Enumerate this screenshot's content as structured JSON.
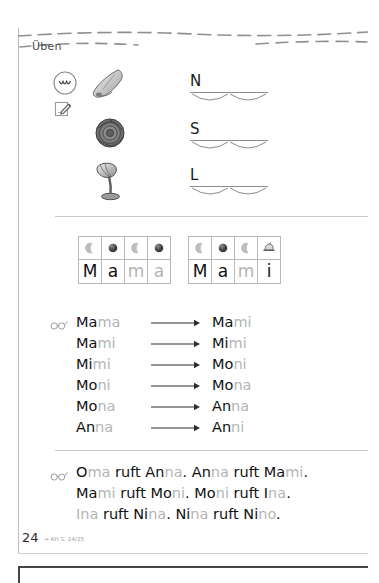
{
  "page": {
    "section_label": "Üben",
    "number": "24",
    "reference": "→ AH S. 24/25"
  },
  "icons": {
    "speak": "mouth-speak-icon",
    "write": "write-pencil-icon",
    "glasses": "glasses-read-icon",
    "consonant_marker": "crescent-moon-icon",
    "vowel_marker": "filled-circle-icon",
    "special_marker": "spinning-top-icon"
  },
  "letter_exercise": {
    "rows": [
      {
        "picture": "nose-picture",
        "letter": "N",
        "word": "Nase"
      },
      {
        "picture": "rose-picture",
        "letter": "S",
        "word": "Rose"
      },
      {
        "picture": "lamp-picture",
        "letter": "L",
        "word": "Lampe"
      }
    ]
  },
  "syllable_boxes": [
    {
      "word": "Mama",
      "cells": [
        {
          "char": "M",
          "tone": "dark",
          "marker": "crescent"
        },
        {
          "char": "a",
          "tone": "dark",
          "marker": "circle"
        },
        {
          "char": "m",
          "tone": "light",
          "marker": "crescent"
        },
        {
          "char": "a",
          "tone": "light",
          "marker": "circle"
        }
      ]
    },
    {
      "word": "Mami",
      "cells": [
        {
          "char": "M",
          "tone": "dark",
          "marker": "crescent"
        },
        {
          "char": "a",
          "tone": "dark",
          "marker": "circle"
        },
        {
          "char": "m",
          "tone": "light",
          "marker": "crescent"
        },
        {
          "char": "i",
          "tone": "dark",
          "marker": "top"
        }
      ]
    }
  ],
  "word_chain": {
    "arrow": "arrow-right-icon",
    "rows": [
      {
        "left": [
          {
            "t": "Ma",
            "tone": "dark"
          },
          {
            "t": "ma",
            "tone": "light"
          }
        ],
        "right": [
          {
            "t": "Ma",
            "tone": "dark"
          },
          {
            "t": "mi",
            "tone": "light"
          }
        ]
      },
      {
        "left": [
          {
            "t": "Ma",
            "tone": "dark"
          },
          {
            "t": "mi",
            "tone": "light"
          }
        ],
        "right": [
          {
            "t": "Mi",
            "tone": "dark"
          },
          {
            "t": "mi",
            "tone": "light"
          }
        ]
      },
      {
        "left": [
          {
            "t": "Mi",
            "tone": "dark"
          },
          {
            "t": "mi",
            "tone": "light"
          }
        ],
        "right": [
          {
            "t": "Mo",
            "tone": "dark"
          },
          {
            "t": "ni",
            "tone": "light"
          }
        ]
      },
      {
        "left": [
          {
            "t": "Mo",
            "tone": "dark"
          },
          {
            "t": "ni",
            "tone": "light"
          }
        ],
        "right": [
          {
            "t": "Mo",
            "tone": "dark"
          },
          {
            "t": "na",
            "tone": "light"
          }
        ]
      },
      {
        "left": [
          {
            "t": "Mo",
            "tone": "dark"
          },
          {
            "t": "na",
            "tone": "light"
          }
        ],
        "right": [
          {
            "t": "An",
            "tone": "dark"
          },
          {
            "t": "na",
            "tone": "light"
          }
        ]
      },
      {
        "left": [
          {
            "t": "An",
            "tone": "dark"
          },
          {
            "t": "na",
            "tone": "light"
          }
        ],
        "right": [
          {
            "t": "An",
            "tone": "dark"
          },
          {
            "t": "ni",
            "tone": "light"
          }
        ]
      }
    ]
  },
  "sentences": {
    "lines": [
      [
        {
          "t": "O",
          "tone": "dark"
        },
        {
          "t": "ma",
          "tone": "light"
        },
        {
          "t": " ruft ",
          "tone": "dark"
        },
        {
          "t": "An",
          "tone": "dark"
        },
        {
          "t": "na",
          "tone": "light"
        },
        {
          "t": ". ",
          "tone": "dark"
        },
        {
          "t": "An",
          "tone": "dark"
        },
        {
          "t": "na",
          "tone": "light"
        },
        {
          "t": " ruft ",
          "tone": "dark"
        },
        {
          "t": "Ma",
          "tone": "dark"
        },
        {
          "t": "mi",
          "tone": "light"
        },
        {
          "t": ".",
          "tone": "dark"
        }
      ],
      [
        {
          "t": "Ma",
          "tone": "dark"
        },
        {
          "t": "mi",
          "tone": "light"
        },
        {
          "t": " ruft ",
          "tone": "dark"
        },
        {
          "t": "Mo",
          "tone": "dark"
        },
        {
          "t": "ni",
          "tone": "light"
        },
        {
          "t": ". ",
          "tone": "dark"
        },
        {
          "t": "Mo",
          "tone": "dark"
        },
        {
          "t": "ni",
          "tone": "light"
        },
        {
          "t": " ruft ",
          "tone": "dark"
        },
        {
          "t": "I",
          "tone": "dark"
        },
        {
          "t": "na",
          "tone": "light"
        },
        {
          "t": ".",
          "tone": "dark"
        }
      ],
      [
        {
          "t": "I",
          "tone": "light"
        },
        {
          "t": "na",
          "tone": "light"
        },
        {
          "t": " ruft ",
          "tone": "dark"
        },
        {
          "t": "Ni",
          "tone": "dark"
        },
        {
          "t": "na",
          "tone": "light"
        },
        {
          "t": ". ",
          "tone": "dark"
        },
        {
          "t": "Ni",
          "tone": "dark"
        },
        {
          "t": "na",
          "tone": "light"
        },
        {
          "t": " ruft ",
          "tone": "dark"
        },
        {
          "t": "Ni",
          "tone": "dark"
        },
        {
          "t": "no",
          "tone": "light"
        },
        {
          "t": ".",
          "tone": "dark"
        }
      ]
    ]
  },
  "colors": {
    "dark": "#111111",
    "light": "#b4b4b4",
    "rule": "#c9c9c9"
  }
}
